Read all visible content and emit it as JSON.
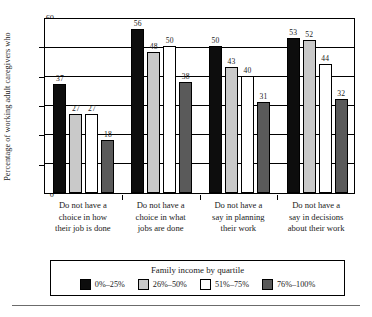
{
  "chart_data": {
    "type": "bar",
    "title": "",
    "xlabel": "",
    "ylabel": "Percentage of working adult caregivers who",
    "ylim": [
      0,
      60
    ],
    "yticks": [
      0,
      10,
      20,
      30,
      40,
      50,
      60
    ],
    "grid": true,
    "legend_position": "bottom",
    "legend_title": "Family income by quartile",
    "categories": [
      "Do not have a choice in how their job is done",
      "Do not have a choice in what jobs are done",
      "Do not have a say in planning their work",
      "Do not have a say in decisions about their work"
    ],
    "series": [
      {
        "name": "0%–25%",
        "color": "#0d0d0d",
        "values": [
          37,
          56,
          50,
          53
        ]
      },
      {
        "name": "26%–50%",
        "color": "#c9c9c9",
        "values": [
          27,
          48,
          43,
          52
        ]
      },
      {
        "name": "51%–75%",
        "color": "#ffffff",
        "values": [
          27,
          50,
          40,
          44
        ]
      },
      {
        "name": "76%–100%",
        "color": "#5a5a5a",
        "values": [
          18,
          38,
          31,
          32
        ]
      }
    ]
  },
  "axis": {
    "y_title": "Percentage of working adult caregivers who",
    "y_tick_labels": [
      "60",
      "50",
      "40",
      "30",
      "20",
      "10",
      "0"
    ]
  },
  "categories": [
    {
      "lines": [
        "Do not have a",
        "choice in how",
        "their job is done"
      ]
    },
    {
      "lines": [
        "Do not have a",
        "choice in what",
        "jobs are done"
      ]
    },
    {
      "lines": [
        "Do not have a",
        "say in planning",
        "their work"
      ]
    },
    {
      "lines": [
        "Do not have a",
        "say in decisions",
        "about their work"
      ]
    }
  ],
  "legend": {
    "title": "Family income by quartile",
    "items": [
      {
        "label": "0%–25%",
        "color": "#0d0d0d"
      },
      {
        "label": "26%–50%",
        "color": "#c9c9c9"
      },
      {
        "label": "51%–75%",
        "color": "#ffffff"
      },
      {
        "label": "76%–100%",
        "color": "#5a5a5a"
      }
    ]
  }
}
